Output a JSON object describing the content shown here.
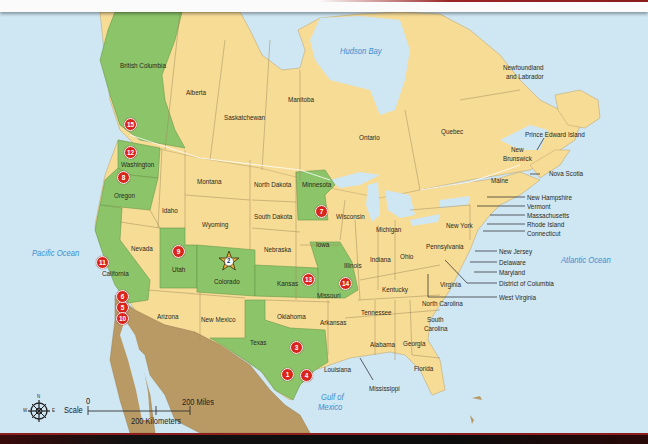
{
  "map": {
    "title": "North America locations map",
    "colors": {
      "ocean": "#cfe6f3",
      "land_default": "#f7dc96",
      "land_highlight": "#8cc46a",
      "mexico": "#b99a64",
      "marker": "#d9261c",
      "star": "#e6b23a",
      "water_label": "#3b8fd0",
      "border": "#8a7a50"
    },
    "water_labels": {
      "hudson_bay": "Hudson Bay",
      "pacific_ocean": "Pacific Ocean",
      "atlantic_ocean": "Atlantic Ocean",
      "gulf_of_mexico_1": "Gulf of",
      "gulf_of_mexico_2": "Mexico"
    },
    "canada": {
      "british_columbia": "British Columbia",
      "alberta": "Alberta",
      "saskatchewan": "Saskatchewan",
      "manitoba": "Manitoba",
      "ontario": "Ontario",
      "quebec": "Quebec",
      "newfoundland_1": "Newfoundland",
      "newfoundland_2": "and Labrador",
      "prince_edward_island": "Prince Edward Island",
      "new_brunswick_1": "New",
      "new_brunswick_2": "Brunswick",
      "nova_scotia": "Nova Scotia"
    },
    "usa": {
      "washington": "Washington",
      "oregon": "Oregon",
      "california": "California",
      "idaho": "Idaho",
      "nevada": "Nevada",
      "montana": "Montana",
      "wyoming": "Wyoming",
      "utah": "Utah",
      "colorado": "Colorado",
      "arizona": "Arizona",
      "new_mexico": "New Mexico",
      "north_dakota": "North Dakota",
      "south_dakota": "South Dakota",
      "nebraska": "Nebraska",
      "kansas": "Kansas",
      "oklahoma": "Oklahoma",
      "texas": "Texas",
      "minnesota": "Minnesota",
      "iowa": "Iowa",
      "missouri": "Missouri",
      "arkansas": "Arkansas",
      "louisiana": "Louisiana",
      "wisconsin": "Wisconsin",
      "illinois": "Illinois",
      "michigan": "Michigan",
      "indiana": "Indiana",
      "ohio": "Ohio",
      "kentucky": "Kentucky",
      "tennessee": "Tennessee",
      "mississippi": "Mississippi",
      "alabama": "Alabama",
      "georgia": "Georgia",
      "florida": "Florida",
      "south_carolina_1": "South",
      "south_carolina_2": "Carolina",
      "north_carolina": "North Carolina",
      "virginia": "Virginia",
      "west_virginia": "West Virginia",
      "pennsylvania": "Pennsylvania",
      "new_york": "New York",
      "maine": "Maine",
      "new_hampshire": "New Hampshire",
      "vermont": "Vermont",
      "massachusetts": "Massachusetts",
      "rhode_island": "Rhode Island",
      "connecticut": "Connecticut",
      "new_jersey": "New Jersey",
      "delaware": "Delaware",
      "maryland": "Maryland",
      "district_of_columbia": "District of Columbia"
    },
    "markers": [
      {
        "id": "1",
        "label": "1"
      },
      {
        "id": "2",
        "label": "2"
      },
      {
        "id": "3",
        "label": "3"
      },
      {
        "id": "4",
        "label": "4"
      },
      {
        "id": "5",
        "label": "5"
      },
      {
        "id": "6",
        "label": "6"
      },
      {
        "id": "7",
        "label": "7"
      },
      {
        "id": "8",
        "label": "8"
      },
      {
        "id": "9",
        "label": "9"
      },
      {
        "id": "10",
        "label": "10"
      },
      {
        "id": "11",
        "label": "11"
      },
      {
        "id": "12",
        "label": "12"
      },
      {
        "id": "13",
        "label": "13"
      },
      {
        "id": "14",
        "label": "14"
      },
      {
        "id": "15",
        "label": "15"
      }
    ],
    "scale": {
      "label": "Scale",
      "zero": "0",
      "miles": "200 Miles",
      "kilometers": "200 Kilometers"
    },
    "compass": {
      "n": "N",
      "s": "S",
      "e": "E",
      "w": "W"
    }
  }
}
